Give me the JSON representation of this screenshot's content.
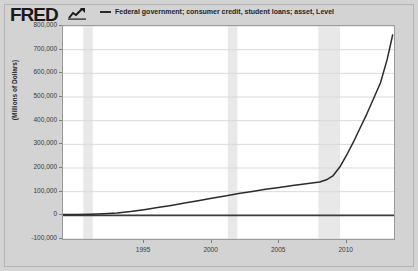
{
  "branding": {
    "logo_text": "FRED",
    "logo_mark_icon": "chart-line-icon"
  },
  "legend": {
    "series_label": "Federal government; consumer credit, student loans; asset, Level",
    "swatch_icon": "line-swatch-icon",
    "color": "#2b2b2b"
  },
  "axes": {
    "y_title": "(Millions of Dollars)",
    "y_ticks": [
      "800,000",
      "700,000",
      "600,000",
      "500,000",
      "400,000",
      "300,000",
      "200,000",
      "100,000",
      "0",
      "-100,000"
    ],
    "x_ticks": [
      "1995",
      "2000",
      "2005",
      "2010"
    ]
  },
  "colors": {
    "page_background": "#d3d3d3",
    "plot_background": "#ffffff",
    "grid": "#d9d9d9",
    "zero_line": "#3c3c3c",
    "series": "#2b2b2b",
    "recession_band": "#e8e8e8",
    "border": "#9a9a9a"
  },
  "chart_data": {
    "type": "line",
    "title": "",
    "xlabel": "",
    "ylabel": "(Millions of Dollars)",
    "xlim": [
      1989.0,
      2013.5
    ],
    "ylim": [
      -100000,
      800000
    ],
    "ytick_values": [
      800000,
      700000,
      600000,
      500000,
      400000,
      300000,
      200000,
      100000,
      0,
      -100000
    ],
    "xtick_values": [
      1995,
      2000,
      2005,
      2010
    ],
    "grid": true,
    "legend_position": "top",
    "series": [
      {
        "name": "Federal government; consumer credit, student loans; asset, Level",
        "color": "#2b2b2b",
        "x": [
          1989.0,
          1990.0,
          1991.0,
          1992.0,
          1993.0,
          1994.0,
          1995.0,
          1996.0,
          1997.0,
          1998.0,
          1999.0,
          2000.0,
          2001.0,
          2002.0,
          2003.0,
          2004.0,
          2005.0,
          2006.0,
          2007.0,
          2008.0,
          2008.5,
          2009.0,
          2009.5,
          2010.0,
          2010.5,
          2011.0,
          2011.5,
          2012.0,
          2012.5,
          2013.0,
          2013.4
        ],
        "y": [
          3000,
          4000,
          5000,
          7000,
          10000,
          16000,
          24000,
          33000,
          42000,
          52000,
          62000,
          72000,
          82000,
          92000,
          101000,
          110000,
          118000,
          126000,
          133000,
          141000,
          150000,
          168000,
          205000,
          255000,
          310000,
          370000,
          430000,
          495000,
          560000,
          660000,
          762000
        ]
      }
    ],
    "zero_line": 0,
    "recession_bands": [
      {
        "start": 1990.5,
        "end": 1991.2
      },
      {
        "start": 2001.2,
        "end": 2001.9
      },
      {
        "start": 2007.9,
        "end": 2009.5
      }
    ]
  }
}
